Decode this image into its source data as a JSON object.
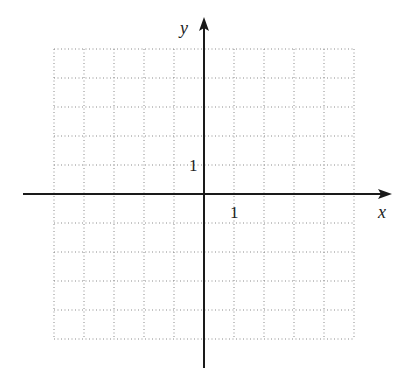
{
  "diagram": {
    "type": "coordinate-grid",
    "x_axis_label": "x",
    "y_axis_label": "y",
    "x_tick_label": "1",
    "y_tick_label": "1",
    "grid": {
      "columns": 10,
      "rows": 10,
      "x_range": [
        -5,
        5
      ],
      "y_range": [
        -5,
        5
      ],
      "line_style": "dotted"
    },
    "colors": {
      "axis": "#1a1a1a",
      "grid": "#8a8a8a",
      "text": "#222222",
      "background": "#ffffff"
    }
  }
}
